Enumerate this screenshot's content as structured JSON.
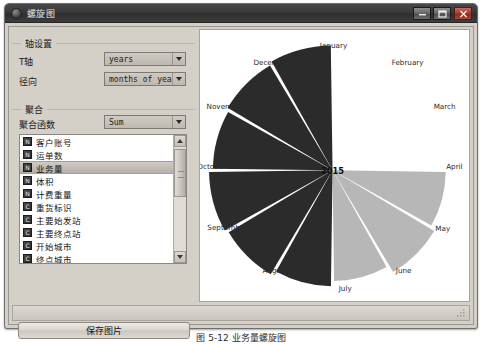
{
  "window": {
    "title": "螺旋图",
    "controls": {
      "minimize": "minimize-icon",
      "maximize": "maximize-icon",
      "close": "close-icon"
    }
  },
  "axis_group": {
    "title": "轴设置",
    "fields": [
      {
        "label": "T轴",
        "value": "years"
      },
      {
        "label": "径向",
        "value": "months of year"
      }
    ]
  },
  "aggregation_group": {
    "title": "聚合",
    "function_label": "聚合函数",
    "function_value": "Sum",
    "items": [
      {
        "icon": "N",
        "label": "客户账号",
        "selected": false
      },
      {
        "icon": "N",
        "label": "运单数",
        "selected": false
      },
      {
        "icon": "N",
        "label": "业务量",
        "selected": true
      },
      {
        "icon": "N",
        "label": "体积",
        "selected": false
      },
      {
        "icon": "N",
        "label": "计费重量",
        "selected": false
      },
      {
        "icon": "C",
        "label": "重货标识",
        "selected": false
      },
      {
        "icon": "C",
        "label": "主要始发站",
        "selected": false
      },
      {
        "icon": "C",
        "label": "主要终点站",
        "selected": false
      },
      {
        "icon": "C",
        "label": "开始城市",
        "selected": false
      },
      {
        "icon": "C",
        "label": "终点城市",
        "selected": false
      }
    ]
  },
  "save_button": {
    "label": "保存图片"
  },
  "caption": "图 5-12  业务量螺旋图",
  "colors": {
    "dark_wedge": "#2b2b2b",
    "light_wedge": "#b7b7b7",
    "chart_bg": "#ffffff",
    "titlebar": "#3a3a3a",
    "panel": "#d4d0c8",
    "close_red": "#9c3c30"
  },
  "chart_data": {
    "type": "pie",
    "title": "",
    "center_label": "2015",
    "legend_position": "none",
    "grid": false,
    "xlabel": "months of year",
    "ylabel": "years",
    "aggregate": "Sum",
    "measure": "业务量",
    "categories": [
      "January",
      "February",
      "March",
      "April",
      "May",
      "June",
      "July",
      "August",
      "September",
      "October",
      "November",
      "December"
    ],
    "values": [
      0,
      0,
      0,
      88,
      92,
      86,
      90,
      94,
      96,
      93,
      95,
      97
    ],
    "colors": [
      "none",
      "none",
      "none",
      "#b7b7b7",
      "#b7b7b7",
      "#b7b7b7",
      "#2b2b2b",
      "#2b2b2b",
      "#2b2b2b",
      "#2b2b2b",
      "#2b2b2b",
      "#2b2b2b"
    ],
    "label_positions": [
      {
        "name": "January",
        "x": 133,
        "y": 18,
        "anchor": "middle"
      },
      {
        "name": "February",
        "x": 209,
        "y": 36,
        "anchor": "middle"
      },
      {
        "name": "March",
        "x": 247,
        "y": 81,
        "anchor": "middle"
      },
      {
        "name": "April",
        "x": 257,
        "y": 143,
        "anchor": "middle"
      },
      {
        "name": "May",
        "x": 245,
        "y": 206,
        "anchor": "middle"
      },
      {
        "name": "June",
        "x": 205,
        "y": 249,
        "anchor": "middle"
      },
      {
        "name": "July",
        "x": 145,
        "y": 268,
        "anchor": "middle"
      },
      {
        "name": "August",
        "x": 73,
        "y": 249,
        "anchor": "middle"
      },
      {
        "name": "September",
        "x": 24,
        "y": 205,
        "anchor": "middle"
      },
      {
        "name": "October",
        "x": 8,
        "y": 143,
        "anchor": "middle"
      },
      {
        "name": "November",
        "x": 22,
        "y": 81,
        "anchor": "middle"
      },
      {
        "name": "December",
        "x": 70,
        "y": 36,
        "anchor": "middle"
      }
    ]
  }
}
